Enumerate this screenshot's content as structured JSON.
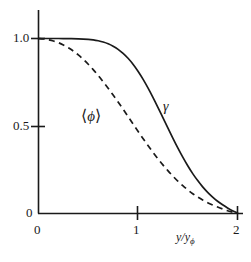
{
  "chart_data": {
    "type": "line",
    "title": "",
    "xlabel": "y/y_phi",
    "ylabel": "",
    "xlim": [
      0,
      2
    ],
    "ylim": [
      0,
      1.05
    ],
    "grid": false,
    "legend": "inline-annotations",
    "xticks": [
      "0",
      "1",
      "2"
    ],
    "xtick_values": [
      0,
      1,
      2
    ],
    "yticks": [
      "0",
      "0.5",
      "1.0"
    ],
    "ytick_values": [
      0,
      0.5,
      1.0
    ],
    "series": [
      {
        "name": "gamma",
        "label": "γ",
        "style": "solid",
        "color": "#1a1a1a",
        "x": [
          0.0,
          0.1,
          0.2,
          0.3,
          0.4,
          0.5,
          0.55,
          0.6,
          0.65,
          0.7,
          0.75,
          0.8,
          0.85,
          0.9,
          0.95,
          1.0,
          1.05,
          1.1,
          1.15,
          1.2,
          1.25,
          1.3,
          1.35,
          1.4,
          1.45,
          1.5,
          1.55,
          1.6,
          1.65,
          1.7,
          1.75,
          1.8,
          1.85,
          1.9,
          1.95,
          2.0
        ],
        "y": [
          1.0,
          1.0,
          1.0,
          0.999,
          0.998,
          0.995,
          0.992,
          0.987,
          0.98,
          0.97,
          0.956,
          0.938,
          0.915,
          0.887,
          0.853,
          0.813,
          0.768,
          0.718,
          0.664,
          0.607,
          0.548,
          0.489,
          0.431,
          0.375,
          0.322,
          0.273,
          0.228,
          0.188,
          0.152,
          0.121,
          0.094,
          0.07,
          0.05,
          0.032,
          0.016,
          0.004
        ]
      },
      {
        "name": "phi-mean",
        "label": "⟨φ⟩",
        "style": "dashed",
        "color": "#1a1a1a",
        "x": [
          0.0,
          0.05,
          0.1,
          0.15,
          0.2,
          0.25,
          0.3,
          0.35,
          0.4,
          0.45,
          0.5,
          0.55,
          0.6,
          0.65,
          0.7,
          0.75,
          0.8,
          0.85,
          0.9,
          0.95,
          1.0,
          1.05,
          1.1,
          1.15,
          1.2,
          1.25,
          1.3,
          1.35,
          1.4,
          1.45,
          1.5,
          1.55,
          1.6,
          1.65,
          1.7,
          1.75,
          1.8,
          1.85,
          1.9,
          1.95,
          2.0
        ],
        "y": [
          1.0,
          0.998,
          0.993,
          0.986,
          0.976,
          0.963,
          0.947,
          0.928,
          0.906,
          0.881,
          0.853,
          0.822,
          0.789,
          0.753,
          0.716,
          0.677,
          0.637,
          0.596,
          0.554,
          0.512,
          0.47,
          0.429,
          0.389,
          0.35,
          0.313,
          0.278,
          0.245,
          0.214,
          0.185,
          0.159,
          0.135,
          0.113,
          0.094,
          0.077,
          0.062,
          0.049,
          0.037,
          0.026,
          0.016,
          0.008,
          0.002
        ]
      }
    ],
    "annotations": [
      {
        "name": "gamma-label",
        "text": "γ",
        "x": 1.26,
        "y": 0.62
      },
      {
        "name": "phi-label",
        "text": "⟨φ⟩",
        "x": 0.46,
        "y": 0.54
      }
    ]
  },
  "axes": {
    "x_title_main": "y/y",
    "x_title_sub": "ϕ",
    "y_tick_1": "1.0",
    "y_tick_05": "0.5",
    "y_tick_0": "0",
    "x_tick_0": "0",
    "x_tick_1": "1",
    "x_tick_2": "2"
  },
  "labels": {
    "gamma": "γ",
    "phi_open": "⟨",
    "phi_symbol": "ϕ",
    "phi_close": "⟩"
  },
  "colors": {
    "line": "#1a1a1a",
    "axis": "#1a1a1a",
    "background": "#ffffff"
  }
}
